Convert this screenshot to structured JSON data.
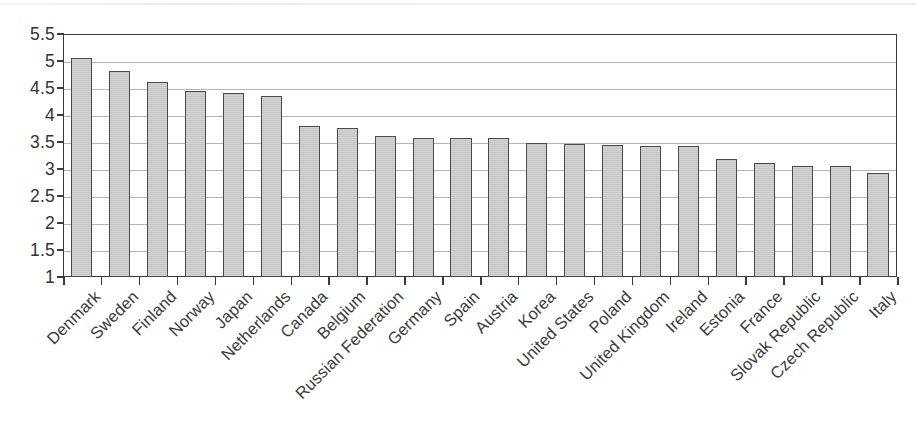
{
  "chart_data": {
    "type": "bar",
    "title": "",
    "subtitle": "",
    "xlabel": "",
    "ylabel": "",
    "ylim": [
      1,
      5.5
    ],
    "ytick_step": 0.5,
    "yticks": [
      "5.5",
      "5",
      "4.5",
      "4",
      "3.5",
      "3",
      "2.5",
      "2",
      "1.5",
      "1"
    ],
    "grid": true,
    "legend": false,
    "legend_position": "none",
    "bar_fill": "#c9c9c9",
    "bar_edge": "#4a4a4a",
    "categories": [
      "Denmark",
      "Sweden",
      "Finland",
      "Norway",
      "Japan",
      "Netherlands",
      "Canada",
      "Belgium",
      "Russian Federation",
      "Germany",
      "Spain",
      "Austria",
      "Korea",
      "United States",
      "Poland",
      "United Kingdom",
      "Ireland",
      "Estonia",
      "France",
      "Slovak Republic",
      "Czech Republic",
      "Italy"
    ],
    "values": [
      5.05,
      4.81,
      4.62,
      4.45,
      4.41,
      4.36,
      3.79,
      3.76,
      3.62,
      3.58,
      3.58,
      3.57,
      3.49,
      3.47,
      3.44,
      3.42,
      3.42,
      3.19,
      3.12,
      3.06,
      3.05,
      2.92
    ]
  }
}
